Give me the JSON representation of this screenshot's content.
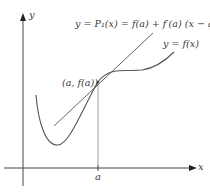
{
  "figure": {
    "axes": {
      "x_label": "x",
      "y_label": "y"
    },
    "labels": {
      "tangent_equation": "y = P₁(x) = f(a) + f′(a) (x − a)",
      "curve": "y = f(x)",
      "point": "(a, f(a))",
      "x_tick": "a"
    },
    "colors": {
      "curve": "#555555",
      "tangent": "#666666",
      "axes": "#444444",
      "guide": "#888888",
      "text": "#3a3a3a"
    }
  }
}
